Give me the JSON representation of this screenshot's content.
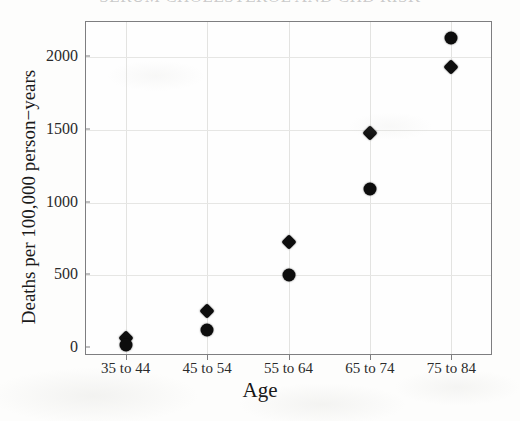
{
  "figure": {
    "title_cropped": "SERUM CHOLESTEROL AND CHD RISK",
    "background_color": "#fdfdfc",
    "marker_color": "#0d0d0d",
    "frame_color": "#7e7e80",
    "grid_color": "#e3e3e1"
  },
  "chart_data": {
    "type": "scatter",
    "title": "",
    "xlabel": "Age",
    "ylabel": "Deaths per 100,000 person−years",
    "categories": [
      "35 to 44",
      "45 to 54",
      "55 to 64",
      "65 to 74",
      "75 to 84"
    ],
    "ylim": [
      0,
      2240
    ],
    "yticks": [
      0,
      500,
      1000,
      1500,
      2000
    ],
    "ytick_labels": [
      "0",
      "500",
      "1000",
      "1500",
      "2000"
    ],
    "grid": true,
    "legend": "none",
    "series": [
      {
        "name": "diamond-series",
        "marker": "diamond",
        "values": [
          60,
          250,
          725,
          1470,
          1925
        ]
      },
      {
        "name": "circle-series",
        "marker": "circle",
        "values": [
          15,
          115,
          495,
          1085,
          2125
        ]
      }
    ]
  }
}
